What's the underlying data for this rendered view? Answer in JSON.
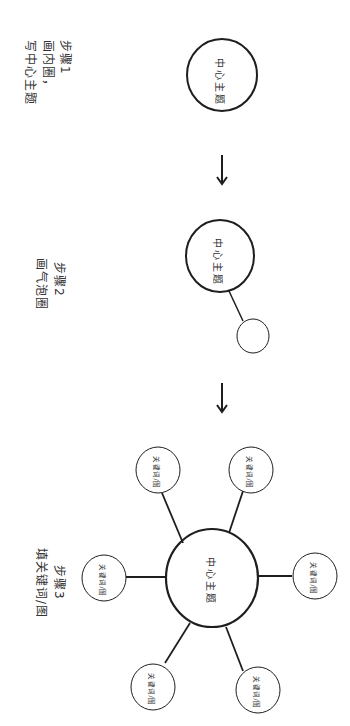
{
  "orientation": "rotated 90 degrees clockwise",
  "steps": [
    {
      "id": 1,
      "title": "步骤1",
      "description_line1": "画内圈，",
      "description_line2": "写中心主题",
      "center_label": "中心主题"
    },
    {
      "id": 2,
      "title": "步骤2",
      "description": "画气泡圈",
      "center_label": "中心主题",
      "bubble_count": 1
    },
    {
      "id": 3,
      "title": "步骤3",
      "description": "填关键词/图",
      "center_label": "中心主题",
      "satellites": [
        {
          "label": "关键词/图"
        },
        {
          "label": "关键词/图"
        },
        {
          "label": "关键词/图"
        },
        {
          "label": "关键词/图"
        },
        {
          "label": "关键词/图"
        },
        {
          "label": "关键词/图"
        }
      ]
    }
  ],
  "arrows": [
    "down",
    "down"
  ],
  "colors": {
    "stroke": "#1e1e1e",
    "text": "#333333",
    "background": "#ffffff"
  }
}
